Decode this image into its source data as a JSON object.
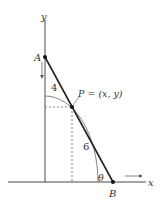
{
  "figure": {
    "labels": {
      "y_axis": "y",
      "x_axis": "x",
      "point_a": "A",
      "point_b": "B",
      "point_p": "P = (x, y)",
      "segment_ap": "4",
      "segment_pb": "6",
      "angle": "θ"
    },
    "colors": {
      "line": "#222222",
      "curve": "#555555",
      "dashed": "#555555",
      "text": "#333333"
    },
    "geometry": {
      "origin": [
        45,
        182
      ],
      "A": [
        45,
        57
      ],
      "P": [
        72,
        107
      ],
      "B": [
        113,
        182
      ],
      "ellipse_rx": 53,
      "ellipse_ry": 86
    }
  }
}
